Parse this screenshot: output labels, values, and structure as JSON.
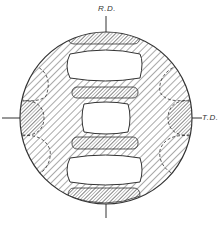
{
  "diagram": {
    "type": "pole-figure",
    "labels": {
      "rd": "R.D.",
      "td": "T.D."
    },
    "colors": {
      "line": "#333333",
      "hatch": "#555555",
      "background": "#ffffff"
    },
    "regions": [
      {
        "name": "top-cap",
        "fill": "dense-hatch"
      },
      {
        "name": "upper-void",
        "fill": "blank"
      },
      {
        "name": "upper-bar",
        "fill": "dense-hatch"
      },
      {
        "name": "center-void",
        "fill": "blank"
      },
      {
        "name": "lower-bar",
        "fill": "dense-hatch"
      },
      {
        "name": "lower-void",
        "fill": "blank"
      },
      {
        "name": "bottom-cap",
        "fill": "dense-hatch"
      },
      {
        "name": "left-lobe",
        "fill": "dense-hatch"
      },
      {
        "name": "right-lobe",
        "fill": "dense-hatch"
      },
      {
        "name": "background-disc",
        "fill": "sparse-hatch"
      }
    ]
  }
}
